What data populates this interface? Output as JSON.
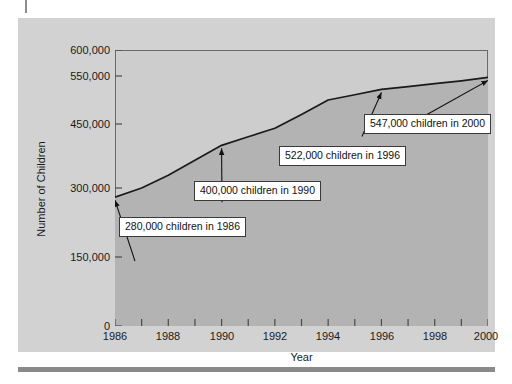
{
  "figure": {
    "background_color": "#d2d2d2",
    "plot_background_color": "#cdcdcd",
    "area_fill_color": "#b3b3b3",
    "line_color": "#1a1a1a"
  },
  "chart_data": {
    "type": "area",
    "title": "",
    "xlabel": "Year",
    "ylabel": "Number of Children",
    "x": [
      1986,
      1987,
      1988,
      1989,
      1990,
      1991,
      1992,
      1993,
      1994,
      1995,
      1996,
      1997,
      1998,
      1999,
      2000
    ],
    "values": [
      280000,
      300000,
      330000,
      365000,
      400000,
      420000,
      440000,
      470000,
      500000,
      511000,
      522000,
      528000,
      534000,
      540000,
      547000
    ],
    "series": [
      {
        "name": "Number of Children",
        "values": [
          280000,
          300000,
          330000,
          365000,
          400000,
          420000,
          440000,
          470000,
          500000,
          511000,
          522000,
          528000,
          534000,
          540000,
          547000
        ]
      }
    ],
    "xlim": [
      1986,
      2000
    ],
    "ylim": [
      0,
      600000
    ],
    "grid": false,
    "legend": false,
    "xticks": [
      1986,
      1988,
      1990,
      1992,
      1994,
      1996,
      1998,
      2000
    ],
    "xtick_labels": [
      "1986",
      "1988",
      "1990",
      "1992",
      "1994",
      "1996",
      "1998",
      "2000"
    ],
    "xticks_minor": [
      1987,
      1989,
      1991,
      1993,
      1995,
      1997,
      1999
    ],
    "yticks": [
      0,
      150000,
      300000,
      450000,
      550000,
      600000
    ],
    "ytick_labels": [
      "0",
      "150,000",
      "300,000",
      "450,000",
      "550,000",
      "600,000"
    ],
    "annotations": [
      {
        "label": "280,000 children in 1986",
        "year": 1986,
        "value": 280000
      },
      {
        "label": "400,000 children in 1990",
        "year": 1990,
        "value": 400000
      },
      {
        "label": "522,000 children in 1996",
        "year": 1996,
        "value": 522000
      },
      {
        "label": "547,000 children in 2000",
        "year": 2000,
        "value": 547000
      }
    ]
  },
  "axes": {
    "y_title": "Number of Children",
    "x_title": "Year",
    "y_labels": {
      "t600": "600,000",
      "t550": "550,000",
      "t450": "450,000",
      "t300": "300,000",
      "t150": "150,000",
      "t0": "0"
    },
    "x_labels": {
      "y1986": "1986",
      "y1988": "1988",
      "y1990": "1990",
      "y1992": "1992",
      "y1994": "1994",
      "y1996": "1996",
      "y1998": "1998",
      "y2000": "2000"
    }
  },
  "callouts": {
    "a1986": "280,000 children in 1986",
    "a1990": "400,000 children in 1990",
    "a1996": "522,000 children in 1996",
    "a2000": "547,000 children in 2000"
  }
}
